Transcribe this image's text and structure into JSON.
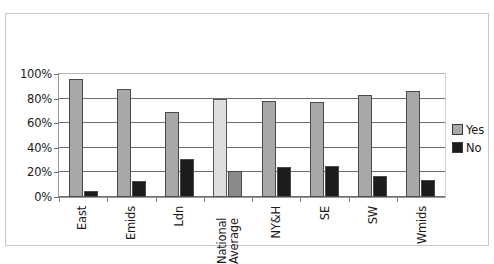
{
  "chart_data": {
    "type": "bar",
    "title": "",
    "xlabel": "",
    "ylabel": "",
    "ylim": [
      0,
      100
    ],
    "yticks": [
      "0%",
      "20%",
      "40%",
      "60%",
      "80%",
      "100%"
    ],
    "grid": true,
    "legend_position": "right",
    "categories": [
      "East",
      "Emids",
      "Ldn",
      "National Average",
      "NY&H",
      "SE",
      "SW",
      "Wmids"
    ],
    "highlight_category": "National Average",
    "series": [
      {
        "name": "Yes",
        "color": "#a8a8a8",
        "values": [
          96,
          88,
          69,
          80,
          78,
          77,
          83,
          86
        ]
      },
      {
        "name": "No",
        "color": "#1c1c1c",
        "values": [
          5,
          13,
          31,
          21,
          24,
          25,
          17,
          14
        ]
      }
    ]
  },
  "legend": {
    "items": [
      {
        "label": "Yes",
        "swatch": "yes"
      },
      {
        "label": "No",
        "swatch": "no"
      }
    ]
  }
}
